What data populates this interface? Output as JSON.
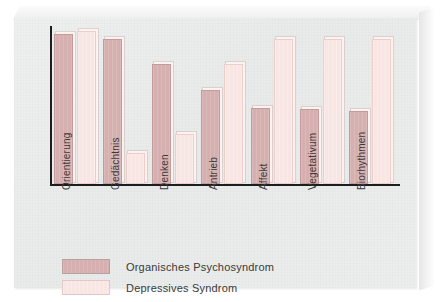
{
  "chart_data": {
    "type": "bar",
    "title": "",
    "xlabel": "",
    "ylabel": "",
    "ylim": [
      0,
      100
    ],
    "grid": false,
    "legend_position": "bottom-left",
    "categories": [
      "Orientierung",
      "Gedächtnis",
      "Denken",
      "Antrieb",
      "Affekt",
      "Vegetativum",
      "Biorhythmen"
    ],
    "series": [
      {
        "name": "Organisches Psychosyndrom",
        "color": "#d6b0b0",
        "values": [
          96,
          93,
          77,
          60,
          49,
          48,
          47
        ]
      },
      {
        "name": "Depressives Syndrom",
        "color": "#f7e6e3",
        "values": [
          98,
          20,
          32,
          77,
          93,
          93,
          93
        ]
      }
    ]
  },
  "legend": {
    "items": [
      {
        "label": "Organisches Psychosyndrom",
        "swatch": "dark"
      },
      {
        "label": "Depressives Syndrom",
        "swatch": "light"
      }
    ]
  }
}
